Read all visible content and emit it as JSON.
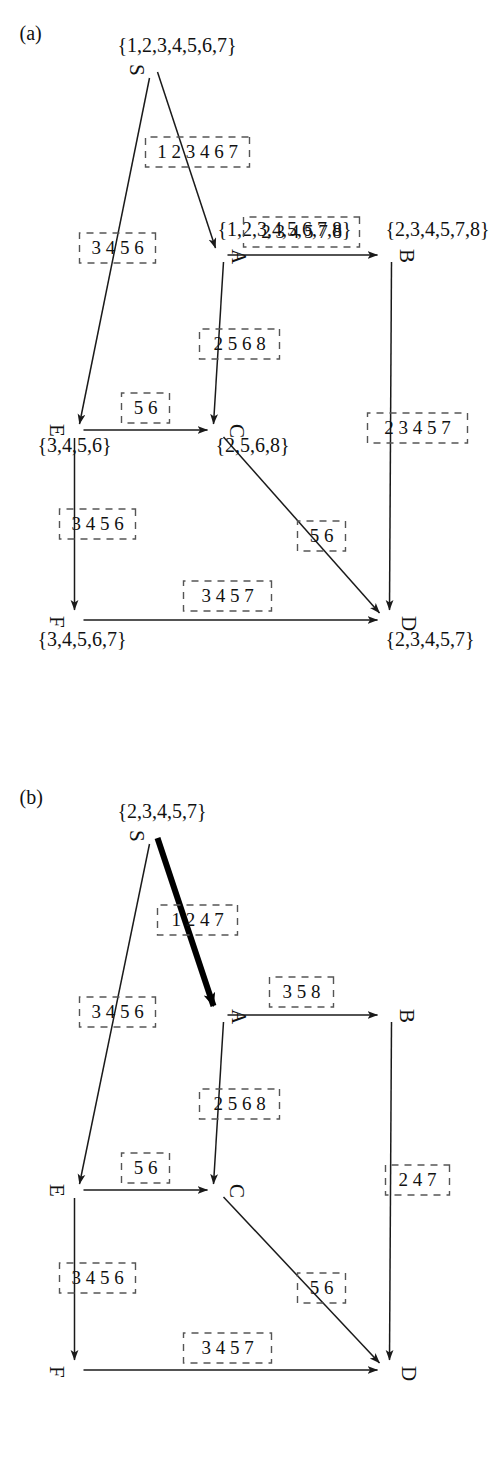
{
  "figure": {
    "type": "graph-diagram",
    "orientation": "rotated-90-ccw",
    "panels": [
      {
        "caption": "(a)",
        "id": "panel-a",
        "nodes": [
          {
            "id": "S",
            "label": "S",
            "set": "{1,2,3,4,5,6,7}"
          },
          {
            "id": "A",
            "label": "A",
            "set": "{1,2,3,4,5,6,7,8}"
          },
          {
            "id": "B",
            "label": "B",
            "set": "{2,3,4,5,7,8}"
          },
          {
            "id": "C",
            "label": "C",
            "set": "{2,5,6,8}"
          },
          {
            "id": "D",
            "label": "D",
            "set": "{2,3,4,5,7}"
          },
          {
            "id": "E",
            "label": "E",
            "set": "{3,4,5,6}"
          },
          {
            "id": "F",
            "label": "F",
            "set": "{3,4,5,6,7}"
          }
        ],
        "edges": [
          {
            "from": "S",
            "to": "A",
            "label": "1 2 3 4 6 7",
            "bold": false
          },
          {
            "from": "S",
            "to": "E",
            "label": "3 4 5 6",
            "bold": false
          },
          {
            "from": "A",
            "to": "B",
            "label": "2 3 4 5 7 8",
            "bold": false
          },
          {
            "from": "A",
            "to": "C",
            "label": "2 5 6 8",
            "bold": false
          },
          {
            "from": "E",
            "to": "C",
            "label": "5 6",
            "bold": false
          },
          {
            "from": "E",
            "to": "F",
            "label": "3 4 5 6",
            "bold": false
          },
          {
            "from": "B",
            "to": "D",
            "label": "2 3 4 5 7",
            "bold": false
          },
          {
            "from": "C",
            "to": "D",
            "label": "5 6",
            "bold": false
          },
          {
            "from": "F",
            "to": "D",
            "label": "3 4 5 7",
            "bold": false
          }
        ]
      },
      {
        "caption": "(b)",
        "id": "panel-b",
        "nodes": [
          {
            "id": "S",
            "label": "S",
            "set": "{2,3,4,5,7}"
          },
          {
            "id": "A",
            "label": "A",
            "set": ""
          },
          {
            "id": "B",
            "label": "B",
            "set": ""
          },
          {
            "id": "C",
            "label": "C",
            "set": ""
          },
          {
            "id": "D",
            "label": "D",
            "set": ""
          },
          {
            "id": "E",
            "label": "E",
            "set": ""
          },
          {
            "id": "F",
            "label": "F",
            "set": ""
          }
        ],
        "edges": [
          {
            "from": "S",
            "to": "A",
            "label": "1 2 4 7",
            "bold": true
          },
          {
            "from": "S",
            "to": "E",
            "label": "3 4 5 6",
            "bold": false
          },
          {
            "from": "A",
            "to": "B",
            "label": "3 5 8",
            "bold": false
          },
          {
            "from": "A",
            "to": "C",
            "label": "2 5 6 8",
            "bold": false
          },
          {
            "from": "E",
            "to": "C",
            "label": "5 6",
            "bold": false
          },
          {
            "from": "E",
            "to": "F",
            "label": "3 4 5 6",
            "bold": false
          },
          {
            "from": "B",
            "to": "D",
            "label": "2 4 7",
            "bold": false
          },
          {
            "from": "C",
            "to": "D",
            "label": "5 6",
            "bold": false
          },
          {
            "from": "F",
            "to": "D",
            "label": "3 4 5 7",
            "bold": false
          }
        ]
      }
    ]
  }
}
